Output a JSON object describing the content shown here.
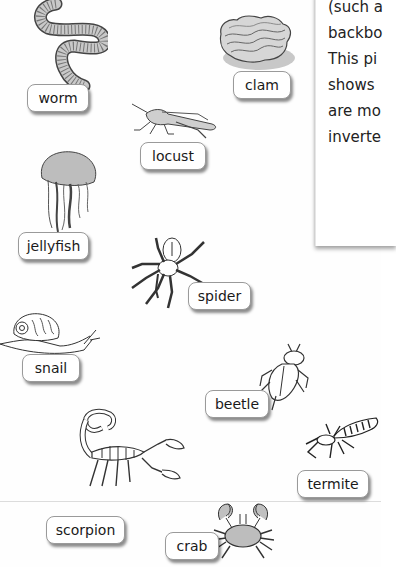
{
  "panel": {
    "lines": [
      "(such a",
      "backbo",
      "This pi",
      "shows",
      "are mo",
      "inverte"
    ]
  },
  "labels": {
    "worm": "worm",
    "clam": "clam",
    "locust": "locust",
    "jellyfish": "jellyfish",
    "spider": "spider",
    "snail": "snail",
    "beetle": "beetle",
    "termite": "termite",
    "scorpion": "scorpion",
    "crab": "crab"
  },
  "colors": {
    "label_border": "#9a9a9a",
    "illustration_fill": "#bdbdbd",
    "illustration_stroke": "#3a3a3a",
    "shadow_gray": "#c8c8c8"
  }
}
